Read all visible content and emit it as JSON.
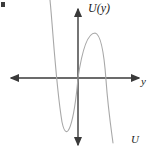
{
  "figure": {
    "background_color": "#ffffff",
    "axis_color": "#3a3a3a",
    "curve_color": "#a8a8a8",
    "width": 154,
    "height": 156
  },
  "labels": {
    "vertical_axis": "U(y)",
    "horizontal_axis": "y",
    "curve": "U"
  },
  "axes": {
    "origin": {
      "x": 78,
      "y": 78
    },
    "horizontal": {
      "name": "y-axis",
      "x_start": 10,
      "x_end": 140,
      "y": 78,
      "arrow_left": true,
      "arrow_right": true
    },
    "vertical": {
      "name": "U-axis",
      "y_start": 8,
      "y_end": 146,
      "x": 78,
      "arrow_up": true,
      "arrow_down": true
    }
  },
  "chart_data": {
    "type": "line",
    "title": "",
    "xlabel": "y",
    "ylabel": "U(y)",
    "grid": false,
    "legend": false,
    "series": [
      {
        "name": "U",
        "description": "Cubic-like potential: descends steeply from upper left, local minimum left of origin, rises through origin to a local maximum right of origin, then falls steeply off the bottom right.",
        "features": {
          "local_minimum": {
            "x": 62,
            "y": 122
          },
          "local_maximum": {
            "x": 95,
            "y": 33
          },
          "zero_crossings": [
            53,
            78,
            105
          ],
          "enters_top_at_x": 50,
          "exits_bottom_at_x": 113
        },
        "path": "M 50,0 C 53,30 56,86 62,122 C 67,146 74,123 78,78 C 83,44 89,33 95,33 C 101,34 104,52 106,80 C 108,108 111,128 113,143"
      }
    ]
  },
  "artifacts": {
    "corner_mark": "scan-artifact"
  }
}
